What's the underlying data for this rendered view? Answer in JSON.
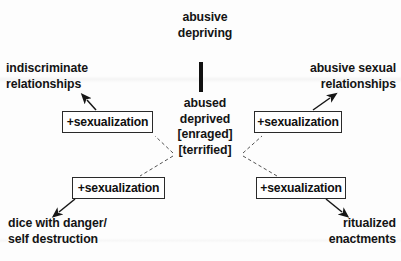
{
  "diagram": {
    "stroke_color": "#2a2a2a",
    "text_color": "#141414",
    "background": "#fdfdfd",
    "nodes": {
      "root": "abusive\ndepriving",
      "core": "abused\ndeprived\n[enraged]\n[terrified]",
      "indiscriminate_relationships": "indiscriminate\nrelationships",
      "abusive_sexual_relationships": "abusive sexual\nrelationships",
      "dice_with_danger": "dice with danger/\nself destruction",
      "ritualized_enactments": "ritualized\nenactments"
    },
    "boxes": {
      "top_left": "+sexualization",
      "bottom_left": "+sexualization",
      "top_right": "+sexualization",
      "bottom_right": "+sexualization"
    },
    "connectors": [
      {
        "from": "core",
        "to": "box_top_left",
        "style": "dashed"
      },
      {
        "from": "core",
        "to": "box_bottom_left",
        "style": "dashed"
      },
      {
        "from": "core",
        "to": "box_top_right",
        "style": "dashed"
      },
      {
        "from": "core",
        "to": "box_bottom_right",
        "style": "dashed"
      },
      {
        "from": "box_top_left",
        "to": "indiscriminate_relationships",
        "style": "solid-arrow"
      },
      {
        "from": "box_bottom_left",
        "to": "dice_with_danger",
        "style": "solid-arrow"
      },
      {
        "from": "box_top_right",
        "to": "abusive_sexual_relationships",
        "style": "solid-arrow"
      },
      {
        "from": "box_bottom_right",
        "to": "ritualized_enactments",
        "style": "solid-arrow"
      },
      {
        "from": "root",
        "to": "core",
        "style": "thick-bar"
      }
    ]
  }
}
